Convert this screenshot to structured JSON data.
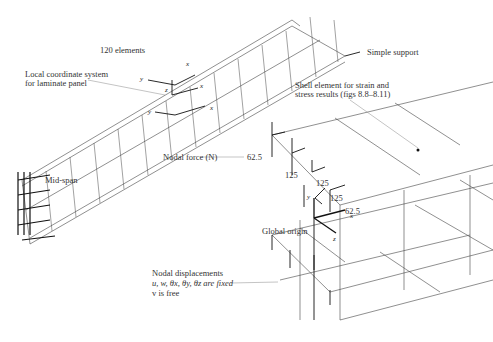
{
  "labels": {
    "elements": "120 elements",
    "simple_support": "Simple support",
    "local_coord_line1": "Local coordinate system",
    "local_coord_line2": "for laminate panel",
    "mid_span": "Mid-span",
    "shell_element_line1": "Shell element for strain and",
    "shell_element_line2": "stress results (figs 8.8–8.11)",
    "nodal_force": "Nodal force (N)",
    "global_origin": "Global origin",
    "nodal_disp_line1": "Nodal displacements",
    "nodal_disp_line2": "u, w, θx, θy, θz are fixed",
    "nodal_disp_line3": "v is free"
  },
  "forces": {
    "f1": "62.5",
    "f2": "125",
    "f3": "125",
    "f4": "125",
    "f5": "62.5"
  },
  "axes": {
    "x": "x",
    "y": "y",
    "z": "z"
  },
  "colors": {
    "line": "#333333",
    "text": "#333333"
  }
}
